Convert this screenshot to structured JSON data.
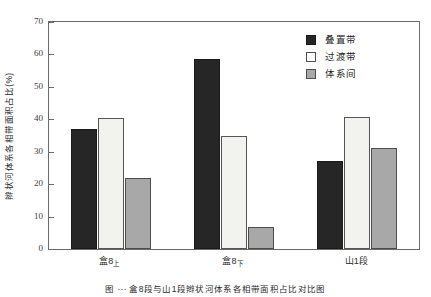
{
  "chart_data": {
    "type": "bar",
    "title": "",
    "xlabel": "",
    "ylabel": "辫状河体系各相带面积占比(%)",
    "ylim": [
      0,
      70
    ],
    "yticks": [
      0,
      10,
      20,
      30,
      40,
      50,
      60,
      70
    ],
    "ytick_labels": [
      "0",
      "10",
      "20",
      "30",
      "40",
      "50",
      "60",
      "70"
    ],
    "grid": false,
    "legend_position": "top-right",
    "categories": [
      "盒8上",
      "盒8下",
      "山1段"
    ],
    "category_labels": [
      {
        "main": "盒8",
        "sub": "上"
      },
      {
        "main": "盒8",
        "sub": "下"
      },
      {
        "main": "山1段",
        "sub": ""
      }
    ],
    "series": [
      {
        "name": "叠置带",
        "color": "#262626",
        "values": [
          37.0,
          58.5,
          27.0
        ]
      },
      {
        "name": "过渡带",
        "color": "#f2f2ef",
        "values": [
          40.5,
          35.0,
          40.8
        ]
      },
      {
        "name": "体系间",
        "color": "#a8a8a8",
        "values": [
          22.0,
          6.8,
          31.0
        ]
      }
    ]
  },
  "legend": {
    "items": [
      {
        "label": "叠置带",
        "swatch": "black-square-swatch"
      },
      {
        "label": "过渡带",
        "swatch": "white-square-swatch"
      },
      {
        "label": "体系间",
        "swatch": "gray-square-swatch"
      }
    ]
  },
  "caption": {
    "text": "图   ···   盒8段与山1段辫状河体系各相带面积占比对比图"
  },
  "colors": {
    "series_0": "#262626",
    "series_1": "#f2f2ef",
    "series_2": "#a8a8a8",
    "axis": "#6b6b6b",
    "text": "#1f1f1f",
    "background": "#ffffff"
  }
}
